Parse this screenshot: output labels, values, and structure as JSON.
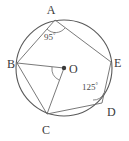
{
  "figure": {
    "type": "circle-geometry-diagram",
    "background_color": "#ffffff",
    "stroke_color": "#555555",
    "label_color": "#3a3a3a",
    "circle": {
      "center_label": "O",
      "center_x": 64,
      "center_y": 68,
      "radius": 48
    },
    "points": [
      {
        "label": "A",
        "x": 55,
        "y": 20,
        "label_x": 51,
        "label_y": 14
      },
      {
        "label": "B",
        "x": 17,
        "y": 63,
        "label_x": 5,
        "label_y": 68
      },
      {
        "label": "C",
        "x": 47,
        "y": 114,
        "label_x": 42,
        "label_y": 132
      },
      {
        "label": "D",
        "x": 102,
        "y": 103,
        "label_x": 107,
        "label_y": 113
      },
      {
        "label": "E",
        "x": 111,
        "y": 62,
        "label_x": 114,
        "label_y": 67
      }
    ],
    "chords": [
      {
        "name": "chord-AB",
        "from": "A",
        "to": "B"
      },
      {
        "name": "chord-AE",
        "from": "A",
        "to": "E"
      },
      {
        "name": "chord-BC",
        "from": "B",
        "to": "C"
      },
      {
        "name": "chord-CD",
        "from": "C",
        "to": "D"
      },
      {
        "name": "chord-DE",
        "from": "D",
        "to": "E"
      }
    ],
    "radii": [
      {
        "name": "radius-OB",
        "from": "O",
        "to": "B"
      },
      {
        "name": "radius-OC",
        "from": "O",
        "to": "C"
      }
    ],
    "angles": [
      {
        "name": "angle-at-A",
        "vertex": "A",
        "value": "95",
        "degree_symbol": "°",
        "label_x": 44,
        "label_y": 39
      },
      {
        "name": "angle-at-D",
        "vertex": "D",
        "value": "125",
        "degree_symbol": "°",
        "label_x": 82,
        "label_y": 89
      }
    ]
  }
}
